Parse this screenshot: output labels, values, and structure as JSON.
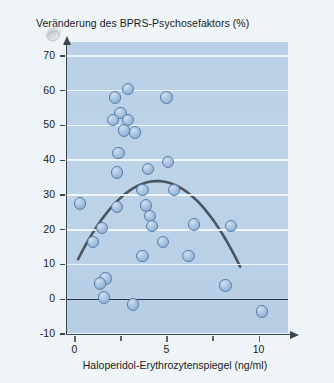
{
  "figure": {
    "background_color": "#eef4f8",
    "plot_background_color": "#b9d0e6",
    "point_color": "#9cbbdf",
    "point_edge_color": "#5c7fa8",
    "curve_color": "#4a5560",
    "gridline_color": "#f4f9fd"
  },
  "chart_data": {
    "type": "scatter",
    "title": "Veränderung des BPRS-Psychosefaktors (%)",
    "xlabel": "Haloperidol-Erythrozytenspiegel (ng/ml)",
    "ylabel": "Veränderung des BPRS-Psychosefaktors (%)",
    "xlim": [
      -0.4,
      11.6
    ],
    "ylim": [
      -10,
      74
    ],
    "xticks": [
      0,
      5,
      10
    ],
    "xtick_labels": [
      "0",
      "5",
      "10"
    ],
    "xminor_ticks": [
      2.5,
      7.5
    ],
    "yticks": [
      -10,
      0,
      10,
      20,
      30,
      40,
      50,
      60,
      70
    ],
    "ytick_labels": [
      "-10",
      "0",
      "10",
      "20",
      "30",
      "40",
      "50",
      "60",
      "70"
    ],
    "grid": "horizontal",
    "legend": "none",
    "points": [
      {
        "x": 2.2,
        "y": 58.0
      },
      {
        "x": 2.9,
        "y": 60.5
      },
      {
        "x": 5.0,
        "y": 58.0
      },
      {
        "x": 2.5,
        "y": 53.5
      },
      {
        "x": 2.1,
        "y": 51.5
      },
      {
        "x": 2.9,
        "y": 51.5
      },
      {
        "x": 2.7,
        "y": 48.5
      },
      {
        "x": 3.3,
        "y": 48.0
      },
      {
        "x": 2.4,
        "y": 42.0
      },
      {
        "x": 2.3,
        "y": 36.5
      },
      {
        "x": 4.0,
        "y": 37.5
      },
      {
        "x": 5.1,
        "y": 39.5
      },
      {
        "x": 3.7,
        "y": 31.5
      },
      {
        "x": 5.4,
        "y": 31.5
      },
      {
        "x": 0.3,
        "y": 27.5
      },
      {
        "x": 2.3,
        "y": 26.5
      },
      {
        "x": 3.9,
        "y": 27.0
      },
      {
        "x": 4.1,
        "y": 24.0
      },
      {
        "x": 4.2,
        "y": 21.0
      },
      {
        "x": 1.5,
        "y": 20.5
      },
      {
        "x": 6.5,
        "y": 21.5
      },
      {
        "x": 8.5,
        "y": 21.0
      },
      {
        "x": 1.0,
        "y": 16.5
      },
      {
        "x": 4.8,
        "y": 16.5
      },
      {
        "x": 3.7,
        "y": 12.5
      },
      {
        "x": 6.2,
        "y": 12.5
      },
      {
        "x": 1.7,
        "y": 6.0
      },
      {
        "x": 1.4,
        "y": 4.5
      },
      {
        "x": 8.2,
        "y": 4.0
      },
      {
        "x": 1.6,
        "y": 0.5
      },
      {
        "x": 3.2,
        "y": -1.5
      },
      {
        "x": 10.2,
        "y": -3.5
      }
    ],
    "fit_curve": {
      "shape": "quadratic",
      "description": "inverted-U regression curve",
      "vertex": {
        "x": 4.5,
        "y": 34.0
      },
      "x_start": 0.2,
      "x_end": 9.0,
      "y_start": 11.5,
      "y_end": 9.0
    }
  }
}
